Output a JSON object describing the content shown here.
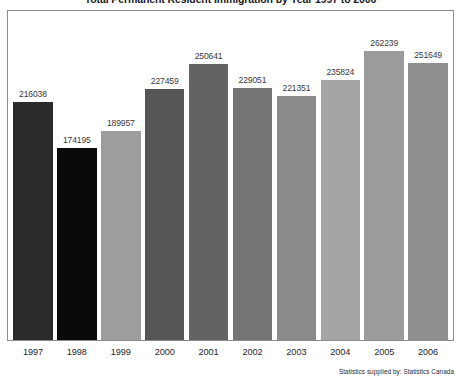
{
  "chart_data": {
    "type": "bar",
    "title": "Total Permanent Resident Immigration by Year 1997 to 2006",
    "xlabel": "",
    "ylabel": "",
    "categories": [
      "1997",
      "1998",
      "1999",
      "2000",
      "2001",
      "2002",
      "2003",
      "2004",
      "2005",
      "2006"
    ],
    "values": [
      216038,
      174195,
      189957,
      227459,
      250641,
      229051,
      221351,
      235824,
      262239,
      251649
    ],
    "value_labels": [
      "216038",
      "174195",
      "189957",
      "227459",
      "250641",
      "229051",
      "221351",
      "235824",
      "262239",
      "251649"
    ],
    "bar_colors": [
      "#2b2b2b",
      "#0a0a0a",
      "#9d9d9d",
      "#565656",
      "#636363",
      "#757575",
      "#8a8a8a",
      "#a5a5a5",
      "#9b9b9b",
      "#8f8f8f"
    ],
    "ylim": [
      0,
      275000
    ],
    "grid": false,
    "legend": null,
    "annotations": [
      "Statistics supplied by: Statistics Canada"
    ]
  },
  "footnote": {
    "text": "Statistics supplied by: Statistics Canada"
  },
  "style": {
    "frame_color": "#8c8c8c",
    "background": "#ffffff",
    "label_color": "#3a3a3a"
  }
}
